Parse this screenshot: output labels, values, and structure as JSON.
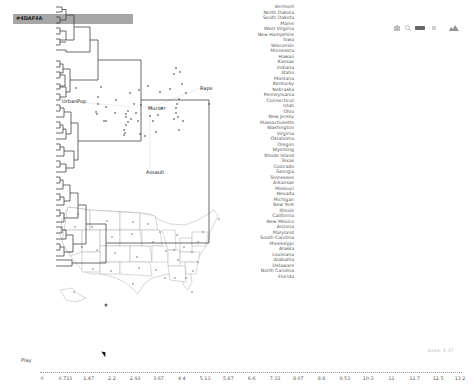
{
  "header": {
    "title": "#4DAF4A"
  },
  "toolbar": {
    "icons": [
      "camera-icon",
      "zoom-icon",
      "pan-icon",
      "select-icon",
      "area-chart-icon"
    ]
  },
  "biplot": {
    "vectors": [
      {
        "label": "UrbanPop",
        "x": 62,
        "y": 100
      },
      {
        "label": "Murder",
        "x": 148,
        "y": 107
      },
      {
        "label": "Rape",
        "x": 200,
        "y": 87
      },
      {
        "label": "Assault",
        "x": 145,
        "y": 171
      }
    ]
  },
  "dendrogram": {
    "leaves": [
      "Vermont",
      "North Dakota",
      "South Dakota",
      "Maine",
      "West Virginia",
      "New Hampshire",
      "Iowa",
      "Wisconsin",
      "Minnesota",
      "Hawaii",
      "Kansas",
      "Indiana",
      "Idaho",
      "Montana",
      "Kentucky",
      "Nebraska",
      "Pennsylvania",
      "Connecticut",
      "Utah",
      "Ohio",
      "New Jersey",
      "Massachusetts",
      "Washington",
      "Virginia",
      "Oklahoma",
      "Oregon",
      "Wyoming",
      "Rhode Island",
      "Texas",
      "Colorado",
      "Georgia",
      "Tennessee",
      "Arkansas",
      "Missouri",
      "Nevada",
      "Michigan",
      "New York",
      "Illinois",
      "California",
      "New Mexico",
      "Arizona",
      "Maryland",
      "South Carolina",
      "Mississippi",
      "Alaska",
      "Louisiana",
      "Alabama",
      "Delaware",
      "North Carolina",
      "Florida"
    ]
  },
  "slider": {
    "play_label": "Play",
    "readout": "aaaa: 8.47",
    "ticks": [
      "0",
      "0.733",
      "1.47",
      "2.2",
      "2.93",
      "3.67",
      "4.4",
      "5.13",
      "5.87",
      "6.6",
      "7.33",
      "8.07",
      "8.8",
      "9.53",
      "10.3",
      "11",
      "11.7",
      "12.5",
      "13.2"
    ]
  }
}
